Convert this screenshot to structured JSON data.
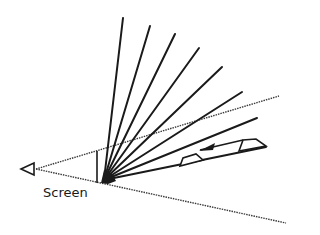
{
  "diagram": {
    "labels": {
      "screen": "Screen"
    },
    "colors": {
      "stroke": "#1a1a1a",
      "dotted": "#3a3a3a",
      "background": "#ffffff"
    },
    "origin": [
      104,
      180
    ],
    "rays": [
      [
        123,
        18
      ],
      [
        150,
        26
      ],
      [
        175,
        34
      ],
      [
        199,
        48
      ],
      [
        222,
        67
      ],
      [
        242,
        92
      ],
      [
        257,
        118
      ],
      [
        266,
        147
      ]
    ]
  }
}
